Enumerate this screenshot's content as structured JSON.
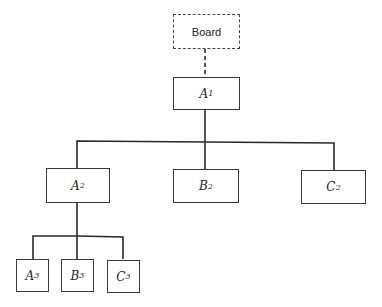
{
  "diagram": {
    "type": "organization-chart",
    "nodes": {
      "board": {
        "label": "Board",
        "style": "dashed"
      },
      "a1": {
        "letter": "A",
        "sub": "1"
      },
      "a2": {
        "letter": "A",
        "sub": "2"
      },
      "b2": {
        "letter": "B",
        "sub": "2"
      },
      "c2": {
        "letter": "C",
        "sub": "2"
      },
      "a3": {
        "letter": "A",
        "sub": "3"
      },
      "b3": {
        "letter": "B",
        "sub": "3"
      },
      "c3": {
        "letter": "C",
        "sub": "3"
      }
    },
    "edges": [
      {
        "from": "board",
        "to": "a1",
        "style": "dashed"
      },
      {
        "from": "a1",
        "to": "a2"
      },
      {
        "from": "a1",
        "to": "b2"
      },
      {
        "from": "a1",
        "to": "c2"
      },
      {
        "from": "a2",
        "to": "a3"
      },
      {
        "from": "a2",
        "to": "b3"
      },
      {
        "from": "a2",
        "to": "c3"
      }
    ],
    "colors": {
      "line": "#2a2a2a",
      "background": "#ffffff"
    }
  }
}
